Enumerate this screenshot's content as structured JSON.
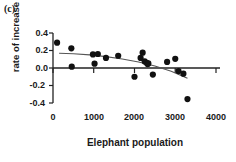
{
  "panel": {
    "label": "(c)"
  },
  "chart_data": {
    "type": "scatter",
    "title": "",
    "panel_label": "(c)",
    "xlabel": "Elephant population",
    "ylabel": "rate of increase",
    "xlim": [
      0,
      4000
    ],
    "ylim": [
      -0.4,
      0.4
    ],
    "xticks": [
      0,
      1000,
      2000,
      3000,
      4000
    ],
    "xtick_labels": [
      "0",
      "1000",
      "2000",
      "3000",
      "4000"
    ],
    "yticks": [
      0.4,
      0.2,
      0.0,
      -0.2,
      -0.4
    ],
    "ytick_labels": [
      "0.4",
      "0.2",
      "0.0",
      "-0.2",
      "-0.4"
    ],
    "grid": false,
    "legend": null,
    "marker": {
      "shape": "circle",
      "color": "#111111",
      "size": 3.1
    },
    "zero_line": {
      "y": 0.0,
      "color": "#222222",
      "extends_to": 4000
    },
    "points": [
      {
        "x": 100,
        "y": 0.29
      },
      {
        "x": 450,
        "y": 0.225
      },
      {
        "x": 460,
        "y": 0.015
      },
      {
        "x": 980,
        "y": 0.155
      },
      {
        "x": 1020,
        "y": 0.05
      },
      {
        "x": 1100,
        "y": 0.16
      },
      {
        "x": 1300,
        "y": 0.115
      },
      {
        "x": 1600,
        "y": 0.14
      },
      {
        "x": 2000,
        "y": -0.1
      },
      {
        "x": 2150,
        "y": 0.115
      },
      {
        "x": 2200,
        "y": 0.175
      },
      {
        "x": 2250,
        "y": 0.075
      },
      {
        "x": 2300,
        "y": 0.06
      },
      {
        "x": 2320,
        "y": 0.045
      },
      {
        "x": 2340,
        "y": 0.052
      },
      {
        "x": 2450,
        "y": -0.075
      },
      {
        "x": 2800,
        "y": 0.07
      },
      {
        "x": 3000,
        "y": 0.105
      },
      {
        "x": 3080,
        "y": -0.035
      },
      {
        "x": 3200,
        "y": -0.065
      },
      {
        "x": 3300,
        "y": -0.355
      }
    ],
    "fit_curve": {
      "name": "fitted trend",
      "color": "#555555",
      "x_range": [
        150,
        3300
      ],
      "points": [
        {
          "x": 150,
          "y": 0.168
        },
        {
          "x": 500,
          "y": 0.163
        },
        {
          "x": 900,
          "y": 0.15
        },
        {
          "x": 1300,
          "y": 0.13
        },
        {
          "x": 1700,
          "y": 0.103
        },
        {
          "x": 2100,
          "y": 0.068
        },
        {
          "x": 2500,
          "y": 0.022
        },
        {
          "x": 2900,
          "y": -0.038
        },
        {
          "x": 3300,
          "y": -0.118
        }
      ]
    }
  }
}
